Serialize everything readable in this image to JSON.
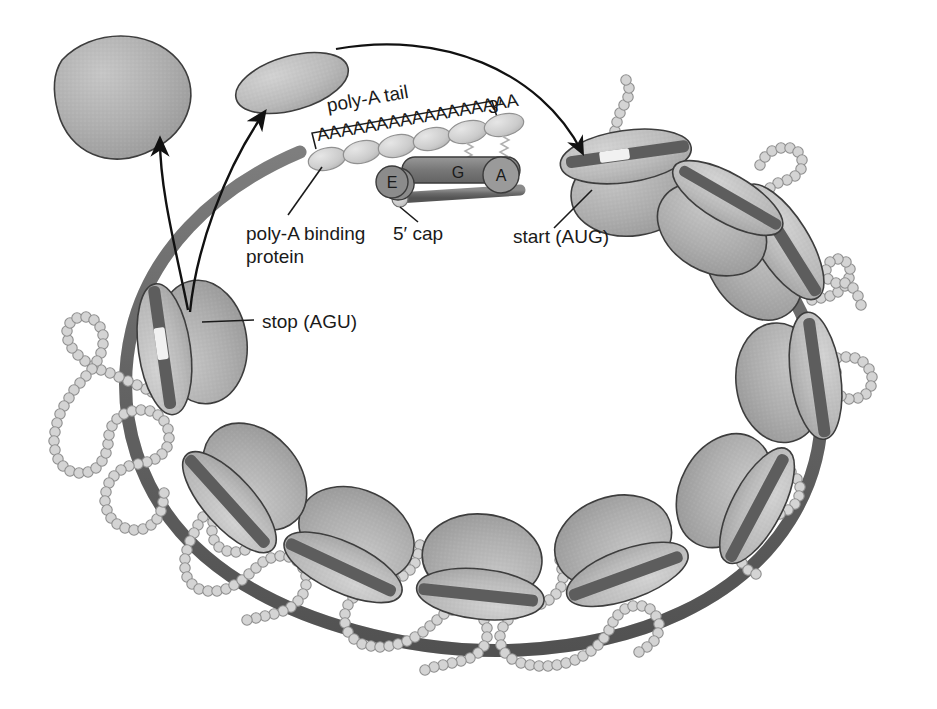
{
  "figure": {
    "background_color": "#ffffff"
  },
  "labels": {
    "poly_a_tail": "poly-A tail",
    "three_prime": "3′",
    "poly_a_sequence": "AAAAAAAAAAAAAAAAA",
    "poly_a_binding_protein": "poly-A binding",
    "poly_a_binding_protein_line2": "protein",
    "five_prime_cap": "5′ cap",
    "start_codon": "start (AUG)",
    "stop_codon": "stop (AGU)",
    "site_e": "E",
    "site_g": "G",
    "site_a": "A"
  },
  "colors": {
    "mrna_strand": "#6e6e6e",
    "ribosome_large": "#a9a9a9",
    "ribosome_small": "#b8b8b8",
    "ribosome_outline": "#3a3a3a",
    "polypeptide_bead": "#d0d0d0",
    "polypeptide_outline": "#8a8a8a",
    "pabp_fill": "#cfcfcf",
    "initiation_factor_G": "#7d7d7d",
    "cap_fill": "#c8c8c8",
    "text": "#1a1a1a",
    "codon_window": "#f2f2f2"
  },
  "elements": {
    "ribosome_count_on_loop": 10,
    "free_subunit_count": 2,
    "pabp_count": 6,
    "dissociation_arrow_count": 2,
    "polypeptide_chain_count": 8,
    "spring_connector_count": 2
  }
}
